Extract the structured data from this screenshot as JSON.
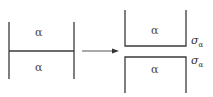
{
  "diagram": {
    "left_figure": {
      "top_phase_label": "α",
      "bottom_phase_label": "α"
    },
    "arrow": {
      "direction": "right"
    },
    "right_figure": {
      "top_phase_label": "α",
      "bottom_phase_label": "α",
      "top_surface_energy_symbol": "σ",
      "top_surface_energy_subscript": "α",
      "bottom_surface_energy_symbol": "σ",
      "bottom_surface_energy_subscript": "α"
    },
    "colors": {
      "line": "#3a3a3a",
      "background": "#ffffff"
    }
  }
}
